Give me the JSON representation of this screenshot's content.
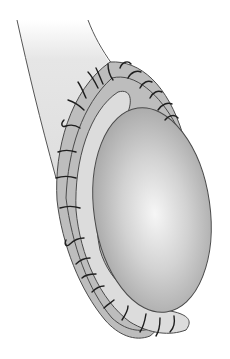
{
  "figure": {
    "type": "surgical-illustration",
    "colors": {
      "background": "#ffffff",
      "tube_fill": "#e4e4e4",
      "cuff_fill": "#bdbdbd",
      "inner_band_fill": "#dcdcdc",
      "ellipsoid_light": "#f4f4f4",
      "ellipsoid_mid": "#c6c6c6",
      "ellipsoid_dark": "#9a9a9a",
      "outline": "#4a4a4a",
      "suture": "#1e1e1e"
    },
    "suture_count": 24
  }
}
